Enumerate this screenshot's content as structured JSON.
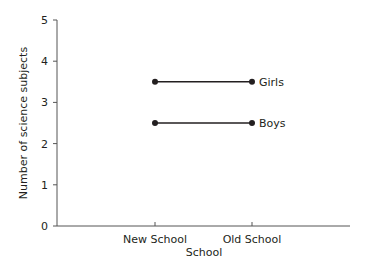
{
  "chart_data": {
    "type": "line",
    "title": "",
    "xlabel": "School",
    "ylabel": "Number of science subjects",
    "categories": [
      "New School",
      "Old School"
    ],
    "series": [
      {
        "name": "Girls",
        "values": [
          3.5,
          3.5
        ]
      },
      {
        "name": "Boys",
        "values": [
          2.5,
          2.5
        ]
      }
    ],
    "ylim": [
      0,
      5
    ],
    "yticks": [
      "0",
      "1",
      "2",
      "3",
      "4",
      "5"
    ],
    "grid": false,
    "legend_position": "inline-right-of-lines"
  },
  "colors": {
    "line": "#231f20",
    "axis": "#555555"
  }
}
